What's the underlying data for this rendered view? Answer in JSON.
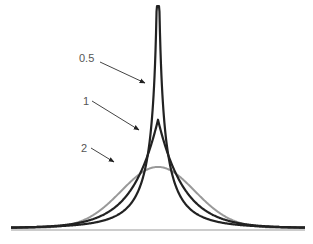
{
  "chart_data": {
    "type": "line",
    "title": "",
    "xlabel": "",
    "ylabel": "",
    "grid": false,
    "legend": "inline arrow annotations",
    "xlim": [
      -4,
      4
    ],
    "ylim": [
      0,
      1.45
    ],
    "series": [
      {
        "name": "0.5",
        "shape": 0.5,
        "color": "#222222",
        "width": 2.2,
        "peak": 1.41,
        "label_pos": [
          79,
          58
        ],
        "arrow_from": [
          100,
          62
        ],
        "arrow_to": [
          145,
          83
        ]
      },
      {
        "name": "1",
        "shape": 1,
        "color": "#222222",
        "width": 2.2,
        "peak": 0.707,
        "label_pos": [
          85,
          101
        ],
        "arrow_from": [
          92,
          101
        ],
        "arrow_to": [
          139,
          130
        ]
      },
      {
        "name": "2",
        "shape": 2,
        "color": "#999999",
        "width": 2.0,
        "peak": 0.564,
        "label_pos": [
          82,
          148
        ],
        "arrow_from": [
          91,
          148
        ],
        "arrow_to": [
          114,
          162
        ]
      }
    ],
    "annotations": [
      "0.5",
      "1",
      "2"
    ],
    "baseline": {
      "y": 0,
      "color": "#999999"
    }
  }
}
